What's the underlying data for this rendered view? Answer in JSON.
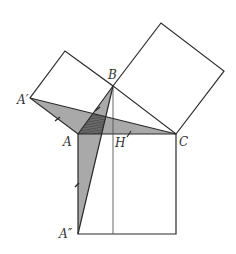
{
  "diagram": {
    "labels": {
      "A": "A",
      "B": "B",
      "C": "C",
      "H": "H",
      "A_prime": "A′",
      "A_double_prime": "A″"
    },
    "colors": {
      "stroke": "#2a2a2a",
      "thin_stroke": "#555555",
      "shade": "#a9a9a9",
      "dark_shade": "#5e5e5e",
      "background": "#ffffff"
    },
    "points": {
      "A": [
        78,
        134
      ],
      "B": [
        113,
        86
      ],
      "C": [
        176,
        134
      ],
      "H": [
        113,
        134
      ],
      "A_prime": [
        30,
        98
      ],
      "A_double_prime": [
        78,
        234
      ]
    }
  }
}
